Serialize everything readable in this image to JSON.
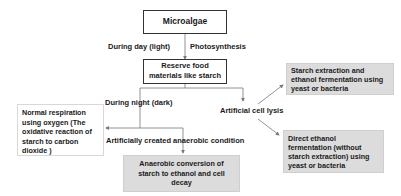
{
  "diagram": {
    "nodes": {
      "microalgae": "Microalgae",
      "reserve": "Reserve food materials like starch",
      "reserve_line1": "Reserve food",
      "reserve_line2": "materials like starch",
      "respiration": "Normal respiration using oxygen (The oxidative reaction of starch to carbon dioxide )",
      "anaerobic": "Anaerobic conversion of starch to ethanol and cell decay",
      "starch_extraction": "Starch extraction and ethanol fermentation using yeast or bacteria",
      "direct_ethanol": "Direct ethanol fermentation (without starch extraction) using yeast or bacteria"
    },
    "edge_labels": {
      "day": "During day (light)",
      "photosynthesis": "Photosynthesis",
      "night": "During night (dark)",
      "anaerobic_condition": "Artificially created anaerobic condition",
      "cell_lysis": "Artificial cell lysis"
    },
    "colors": {
      "line": "#777777",
      "shaded_box": "#dcdcdc"
    }
  }
}
